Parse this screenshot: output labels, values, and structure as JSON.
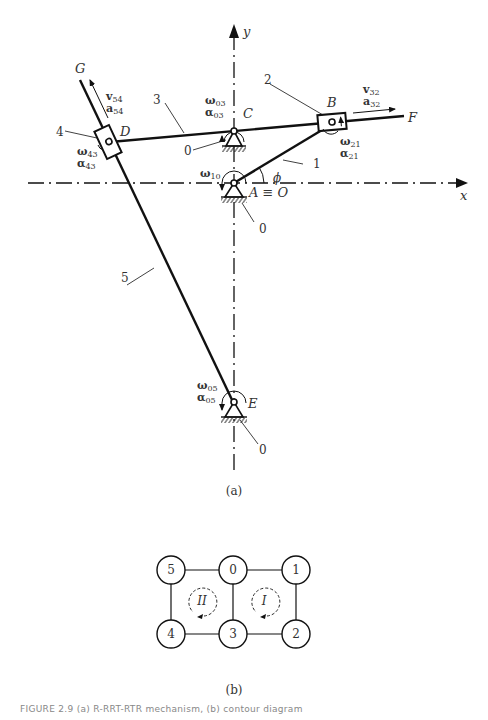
{
  "figure": {
    "panel_a_label": "(a)",
    "panel_b_label": "(b)",
    "caption_fragment": "FIGURE 2.9  (a) R-RRT-RTR mechanism, (b) contour diagram"
  },
  "axes": {
    "x_label": "x",
    "y_label": "y"
  },
  "joints": {
    "A": "A ≡ O",
    "B": "B",
    "C": "C",
    "D": "D",
    "E": "E",
    "F": "F",
    "G": "G"
  },
  "links": {
    "l1": "1",
    "l2": "2",
    "l3": "3",
    "l4": "4",
    "l5": "5",
    "ground_c": "0",
    "ground_a": "0",
    "ground_e": "0"
  },
  "angle": "ϕ",
  "vectors": {
    "v54": "v",
    "v54_sub": "54",
    "a54": "a",
    "a54_sub": "54",
    "v32": "v",
    "v32_sub": "32",
    "a32": "a",
    "a32_sub": "32",
    "w03": "ω",
    "w03_sub": "03",
    "al03": "α",
    "al03_sub": "03",
    "w43": "ω",
    "w43_sub": "43",
    "al43": "α",
    "al43_sub": "43",
    "w21": "ω",
    "w21_sub": "21",
    "al21": "α",
    "al21_sub": "21",
    "w10": "ω",
    "w10_sub": "10",
    "w05": "ω",
    "w05_sub": "05",
    "al05": "α",
    "al05_sub": "05"
  },
  "graph": {
    "nodes": [
      "5",
      "0",
      "1",
      "4",
      "3",
      "2"
    ],
    "loops": [
      "II",
      "I"
    ]
  }
}
